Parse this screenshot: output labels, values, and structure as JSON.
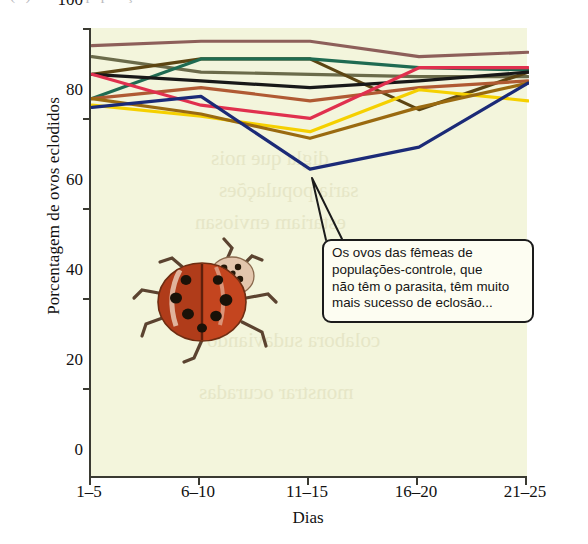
{
  "page": {
    "cropped_header_fragment": "(A)   Machos     população        Fêmeas",
    "background_color": "#ffffff"
  },
  "callout": {
    "name": "callout-annotation",
    "text": "Os ovos das fêmeas de populações-controle, que não têm o parasita, têm muito mais sucesso de eclosão...",
    "lines": [
      "Os ovos das fêmeas de",
      "populações-controle, que",
      "não têm o parasita, têm muito",
      "mais sucesso de eclosão..."
    ],
    "border_color": "#1b1b1b",
    "fill_color": "#fdfdf2"
  },
  "ghost_text": {
    "lines": [
      "digla que nois",
      "saria populações",
      "estariam enviosan",
      "colabora sudaviando",
      "monstrar ocuradas"
    ]
  },
  "illustration": {
    "name": "ladybug-beetle-photo",
    "caption": "Joaninha (ladybird beetle)",
    "body_color": "#c4451f",
    "spot_color": "#1a1208"
  },
  "chart_data": {
    "type": "line",
    "title": "",
    "xlabel": "Dias",
    "ylabel": "Porcentagem de ovos eclodidos",
    "categories": [
      "1–5",
      "6–10",
      "11–15",
      "16–20",
      "21–25"
    ],
    "x_tick_labels": [
      "1–5",
      "6–10",
      "11–15",
      "16–20",
      "21–25"
    ],
    "y_tick_labels": [
      "0",
      "20",
      "40",
      "60",
      "80",
      "100"
    ],
    "y_ticks": [
      0,
      20,
      40,
      60,
      80,
      100
    ],
    "ylim": [
      0,
      102
    ],
    "xlim": [
      0,
      4
    ],
    "grid": false,
    "legend": "none",
    "plot_background": "#f3f5dc",
    "axis_color": "#3a3a32",
    "series": [
      {
        "name": "serie-marrom-claro",
        "color": "#8d5f5a",
        "values": [
          98.0,
          99.0,
          99.0,
          95.5,
          96.5
        ]
      },
      {
        "name": "serie-verde-oliva",
        "color": "#6b6b4a",
        "values": [
          95.5,
          92.0,
          91.5,
          91.0,
          91.0
        ]
      },
      {
        "name": "serie-marrom-escuro",
        "color": "#5c4512",
        "values": [
          91.5,
          95.0,
          95.0,
          83.5,
          92.0
        ]
      },
      {
        "name": "serie-verde-escuro",
        "color": "#1f6b52",
        "values": [
          86.0,
          95.0,
          95.0,
          93.0,
          92.5
        ]
      },
      {
        "name": "serie-preto",
        "color": "#181818",
        "values": [
          91.5,
          90.0,
          88.5,
          90.0,
          92.0
        ]
      },
      {
        "name": "serie-vermelho-tijolo",
        "color": "#b05a33",
        "values": [
          86.0,
          88.5,
          85.5,
          88.5,
          90.0
        ]
      },
      {
        "name": "serie-rosa-carmim",
        "color": "#e0304e",
        "values": [
          91.5,
          84.5,
          81.5,
          93.0,
          93.0
        ]
      },
      {
        "name": "serie-amarelo",
        "color": "#f5d000",
        "values": [
          84.5,
          82.0,
          78.5,
          88.0,
          85.5
        ]
      },
      {
        "name": "serie-ocre",
        "color": "#9a6a10",
        "values": [
          86.0,
          82.5,
          77.0,
          84.0,
          89.5
        ]
      },
      {
        "name": "serie-azul-marinho",
        "color": "#1b2a77",
        "values": [
          84.0,
          86.5,
          70.0,
          75.0,
          89.5
        ]
      }
    ]
  }
}
